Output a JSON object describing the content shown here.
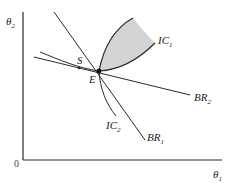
{
  "diagram": {
    "axes": {
      "y_label": "θ",
      "y_label_sub": "2",
      "x_label": "θ",
      "x_label_sub": "1",
      "origin_label": "0"
    },
    "labels": {
      "equilibrium": "E",
      "stackelberg": "S",
      "ic1": "IC",
      "ic1_sub": "1",
      "ic2": "IC",
      "ic2_sub": "2",
      "br1": "BR",
      "br1_sub": "1",
      "br2": "BR",
      "br2_sub": "2"
    },
    "colors": {
      "line": "#2a2a2a",
      "shaded_region": "#d4d4d4",
      "background": "#ffffff"
    }
  }
}
